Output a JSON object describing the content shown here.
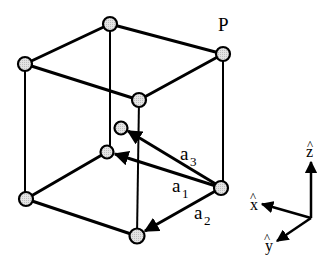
{
  "diagram": {
    "type": "crystal-unit-cell-primitive-vectors",
    "corner_label": "P",
    "vectors": [
      {
        "id": "a1",
        "base": "a",
        "sub": "1"
      },
      {
        "id": "a2",
        "base": "a",
        "sub": "2"
      },
      {
        "id": "a3",
        "base": "a",
        "sub": "3"
      }
    ],
    "axes": [
      {
        "id": "x",
        "label": "x",
        "hat": "^"
      },
      {
        "id": "y",
        "label": "y",
        "hat": "^"
      },
      {
        "id": "z",
        "label": "z",
        "hat": "^"
      }
    ],
    "colors": {
      "line": "#000000",
      "node_fill": "#d9d9d9",
      "background": "#ffffff"
    }
  }
}
